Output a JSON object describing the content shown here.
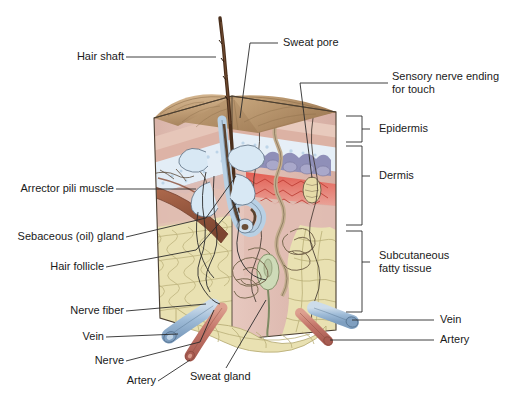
{
  "figure": {
    "type": "anatomical-illustration"
  },
  "labels": {
    "hair_shaft": "Hair shaft",
    "arrector_pili": "Arrector pili muscle",
    "sebaceous_gland": "Sebaceous (oil) gland",
    "hair_follicle": "Hair follicle",
    "nerve_fiber": "Nerve fiber",
    "vein_left": "Vein",
    "nerve": "Nerve",
    "artery_left": "Artery",
    "sweat_gland": "Sweat gland",
    "sweat_pore": "Sweat pore",
    "sensory_nerve_line1": "Sensory nerve ending",
    "sensory_nerve_line2": "for touch",
    "epidermis": "Epidermis",
    "dermis": "Dermis",
    "subcutaneous_line1": "Subcutaneous",
    "subcutaneous_line2": "fatty tissue",
    "vein_right": "Vein",
    "artery_right": "Artery"
  },
  "colors": {
    "leader_line": "#2b2b2b",
    "text": "#1a1a1a",
    "epidermis_surface": "#c6a680",
    "epidermis_surface_dark": "#a8855f",
    "stratum_corneum": "#e8c9bc",
    "stratum_pink": "#e3b7ab",
    "granular_blue": "#dfe9f2",
    "basal_purple": "#9a9bc0",
    "dermis_red": "#e06b62",
    "dermis_pink": "#e0b9b0",
    "dermis_body": "#e3c3bb",
    "fat_yellow": "#e8e0b0",
    "fat_outline": "#b8ae78",
    "hair_brown": "#4a2f1c",
    "muscle_brown": "#9a5a42",
    "vein_blue": "#a8c4dd",
    "artery_red": "#c9796a",
    "sweat_gland_green": "#c9d6b4",
    "corpuscle_yellow": "#e6dba8",
    "nerve_tan": "#d6c3a8",
    "follicle_blue": "#cfe0ee",
    "outline": "#3a3028"
  },
  "brackets": [
    {
      "name": "Epidermis",
      "top": 116,
      "bottom": 142
    },
    {
      "name": "Dermis",
      "top": 146,
      "bottom": 225
    },
    {
      "name": "Subcutaneous fatty tissue",
      "top": 231,
      "bottom": 312
    }
  ]
}
